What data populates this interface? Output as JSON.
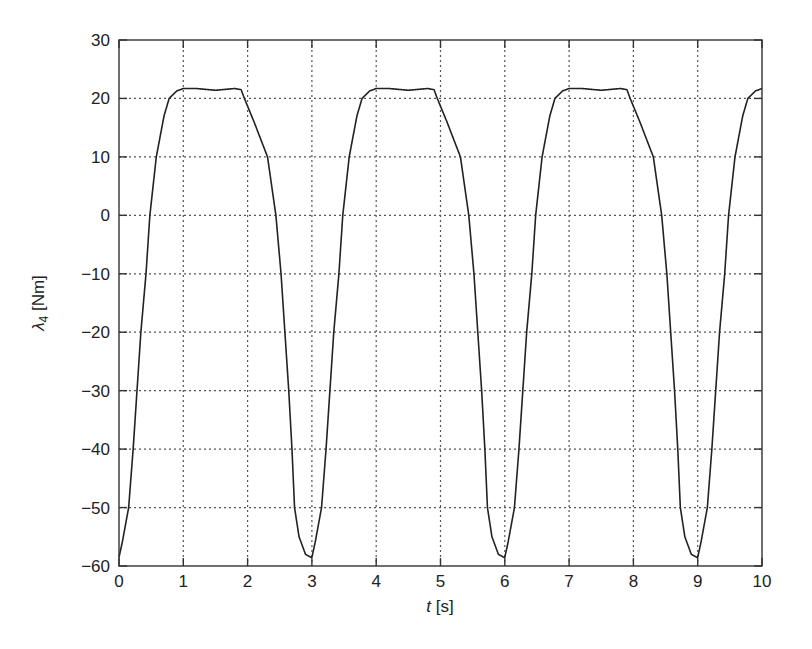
{
  "chart_data": {
    "type": "line",
    "title": "",
    "xlabel": "t [s]",
    "xlabel_italic_part": "t",
    "xlabel_unit_part": " [s]",
    "ylabel": "λ4 [Nm]",
    "ylabel_symbol": "λ",
    "ylabel_subscript": "4",
    "ylabel_unit": " [Nm]",
    "xlim": [
      0,
      10
    ],
    "ylim": [
      -60,
      30
    ],
    "xticks": [
      0,
      1,
      2,
      3,
      4,
      5,
      6,
      7,
      8,
      9,
      10
    ],
    "yticks": [
      -60,
      -50,
      -40,
      -30,
      -20,
      -10,
      0,
      10,
      20,
      30
    ],
    "xtick_labels": [
      "0",
      "1",
      "2",
      "3",
      "4",
      "5",
      "6",
      "7",
      "8",
      "9",
      "10"
    ],
    "ytick_labels": [
      "−60",
      "−50",
      "−40",
      "−30",
      "−20",
      "−10",
      "0",
      "10",
      "20",
      "30"
    ],
    "grid": true,
    "grid_style": "dotted",
    "legend": null,
    "period": 3,
    "cycle_profile": {
      "tau": [
        0,
        0.05,
        0.1,
        0.15,
        0.22,
        0.28,
        0.34,
        0.42,
        0.48,
        0.58,
        0.7,
        0.78,
        0.9,
        1.0,
        1.2,
        1.5,
        1.8,
        1.9,
        1.95,
        2.1,
        2.31,
        2.44,
        2.52,
        2.58,
        2.64,
        2.69,
        2.73,
        2.8,
        2.9,
        3.0
      ],
      "value": [
        -58.5,
        -56,
        -53,
        -50,
        -40,
        -30,
        -20,
        -10,
        0,
        10,
        17,
        20,
        21.3,
        21.7,
        21.7,
        21.4,
        21.7,
        21.5,
        20,
        16,
        10,
        0,
        -10,
        -20,
        -30,
        -40,
        -50,
        -55,
        -58,
        -58.6
      ]
    },
    "series": [
      {
        "name": "lambda_4",
        "color": "#222222",
        "x": [
          0,
          0.5,
          1.0,
          1.5,
          2.0,
          2.5,
          3.0,
          3.5,
          4.0,
          4.5,
          5.0,
          5.5,
          6.0,
          6.5,
          7.0,
          7.5,
          8.0,
          8.5,
          9.0,
          9.5,
          10.0
        ],
        "y": [
          -58.5,
          2,
          21.7,
          21.4,
          19,
          -6,
          -58.6,
          2,
          21.7,
          21.4,
          19,
          -6,
          -58.6,
          2,
          21.7,
          21.4,
          19,
          -6,
          -58.6,
          2,
          21.5
        ]
      }
    ]
  },
  "colors": {
    "line": "#222222",
    "axis": "#333333",
    "grid": "#555555",
    "background": "#ffffff"
  }
}
